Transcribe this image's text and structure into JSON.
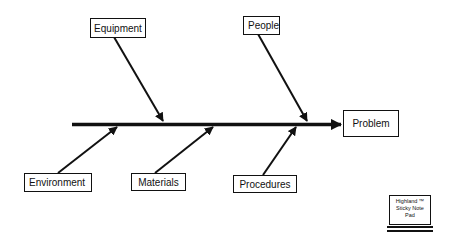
{
  "diagram": {
    "type": "fishbone",
    "effect": {
      "label": "Problem"
    },
    "causes": [
      {
        "label": "Equipment",
        "position": "top"
      },
      {
        "label": "People",
        "position": "top"
      },
      {
        "label": "Environment",
        "position": "bottom"
      },
      {
        "label": "Materials",
        "position": "bottom"
      },
      {
        "label": "Procedures",
        "position": "bottom"
      }
    ],
    "line_color": "#111111"
  },
  "sticky_note": {
    "line1": "Highland ™",
    "line2": "Sticky Note",
    "line3": "Pad"
  }
}
